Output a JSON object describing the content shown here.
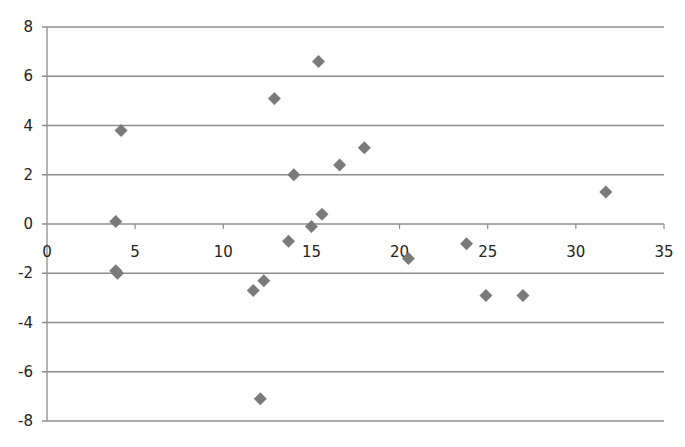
{
  "chart_data": {
    "type": "scatter",
    "title": "",
    "xlabel": "",
    "ylabel": "",
    "xlim": [
      0,
      35
    ],
    "ylim": [
      -8,
      8
    ],
    "x_ticks": [
      0,
      5,
      10,
      15,
      20,
      25,
      30,
      35
    ],
    "y_ticks": [
      8,
      6,
      4,
      2,
      0,
      -2,
      -4,
      -6,
      -8
    ],
    "grid": {
      "horizontal": true,
      "vertical": false
    },
    "legend": null,
    "marker": "diamond",
    "marker_color": "#7a7a7a",
    "gridline_color": "#8c8c8c",
    "series": [
      {
        "name": "Series1",
        "points": [
          {
            "x": 4.2,
            "y": 3.8
          },
          {
            "x": 3.9,
            "y": 0.1
          },
          {
            "x": 3.9,
            "y": -1.9
          },
          {
            "x": 4.0,
            "y": -2.0
          },
          {
            "x": 12.9,
            "y": 5.1
          },
          {
            "x": 15.4,
            "y": 6.6
          },
          {
            "x": 14.0,
            "y": 2.0
          },
          {
            "x": 16.6,
            "y": 2.4
          },
          {
            "x": 18.0,
            "y": 3.1
          },
          {
            "x": 15.6,
            "y": 0.4
          },
          {
            "x": 15.0,
            "y": -0.1
          },
          {
            "x": 13.7,
            "y": -0.7
          },
          {
            "x": 11.7,
            "y": -2.7
          },
          {
            "x": 12.3,
            "y": -2.3
          },
          {
            "x": 12.1,
            "y": -7.1
          },
          {
            "x": 20.5,
            "y": -1.4
          },
          {
            "x": 23.8,
            "y": -0.8
          },
          {
            "x": 24.9,
            "y": -2.9
          },
          {
            "x": 27.0,
            "y": -2.9
          },
          {
            "x": 31.7,
            "y": 1.3
          }
        ]
      }
    ]
  }
}
